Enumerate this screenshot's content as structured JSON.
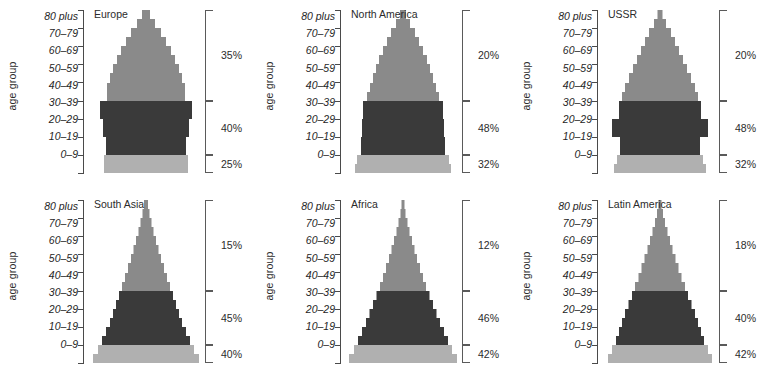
{
  "figure": {
    "type": "population-pyramid-grid",
    "rows": 2,
    "columns": 3,
    "background": "#ffffff"
  },
  "axis": {
    "title": "age group",
    "labels": [
      "80 plus",
      "70–79",
      "60–69",
      "50–59",
      "40–49",
      "30–39",
      "20–29",
      "10–19",
      "0–9"
    ]
  },
  "colors": {
    "band_old": "#8a8a8a",
    "band_middle": "#3a3a3a",
    "band_young": "#b0b0b0",
    "axis": "#4a4a4a",
    "text": "#2b2b2b"
  },
  "bands": [
    {
      "key": "old",
      "label": "40 plus",
      "color": "#8a8a8a"
    },
    {
      "key": "middle",
      "label": "10–39",
      "color": "#3a3a3a"
    },
    {
      "key": "young",
      "label": "0–9",
      "color": "#b0b0b0"
    }
  ],
  "chart_data": {
    "type": "bar",
    "title": "",
    "xlabel": "",
    "ylabel": "age group",
    "categories": [
      "0–4",
      "5–9",
      "10–14",
      "15–19",
      "20–24",
      "25–29",
      "30–34",
      "35–39",
      "40–44",
      "45–49",
      "50–54",
      "55–59",
      "60–64",
      "65–69",
      "70–74",
      "75–79",
      "80–84",
      "85 plus"
    ],
    "legend_position": "none",
    "grid": false,
    "panels": [
      {
        "name": "Europe",
        "position": {
          "row": 0,
          "col": 0
        },
        "percentages": [
          {
            "band": "old",
            "value": "35%"
          },
          {
            "band": "middle",
            "value": "40%"
          },
          {
            "band": "young",
            "value": "25%"
          }
        ],
        "widths": [
          84,
          84,
          80,
          80,
          86,
          86,
          92,
          92,
          78,
          78,
          72,
          66,
          58,
          50,
          40,
          30,
          18,
          8
        ]
      },
      {
        "name": "North America",
        "position": {
          "row": 0,
          "col": 1
        },
        "percentages": [
          {
            "band": "old",
            "value": "20%"
          },
          {
            "band": "middle",
            "value": "48%"
          },
          {
            "band": "young",
            "value": "32%"
          }
        ],
        "widths": [
          96,
          92,
          84,
          84,
          82,
          82,
          80,
          80,
          72,
          66,
          60,
          54,
          48,
          40,
          32,
          24,
          14,
          6
        ]
      },
      {
        "name": "USSR",
        "position": {
          "row": 0,
          "col": 2
        },
        "percentages": [
          {
            "band": "old",
            "value": "20%"
          },
          {
            "band": "middle",
            "value": "48%"
          },
          {
            "band": "young",
            "value": "32%"
          }
        ],
        "widths": [
          92,
          86,
          80,
          80,
          96,
          96,
          82,
          82,
          76,
          70,
          62,
          54,
          46,
          38,
          30,
          22,
          12,
          5
        ]
      },
      {
        "name": "South Asia",
        "position": {
          "row": 1,
          "col": 0
        },
        "percentages": [
          {
            "band": "old",
            "value": "15%"
          },
          {
            "band": "middle",
            "value": "45%"
          },
          {
            "band": "young",
            "value": "40%"
          }
        ],
        "widths": [
          106,
          96,
          88,
          80,
          72,
          66,
          60,
          54,
          48,
          42,
          36,
          30,
          25,
          20,
          15,
          11,
          7,
          4
        ]
      },
      {
        "name": "Africa",
        "position": {
          "row": 1,
          "col": 1
        },
        "percentages": [
          {
            "band": "old",
            "value": "12%"
          },
          {
            "band": "middle",
            "value": "46%"
          },
          {
            "band": "young",
            "value": "42%"
          }
        ],
        "widths": [
          108,
          98,
          90,
          82,
          74,
          67,
          60,
          53,
          46,
          40,
          34,
          28,
          23,
          18,
          13,
          9,
          5,
          3
        ]
      },
      {
        "name": "Latin America",
        "position": {
          "row": 1,
          "col": 2
        },
        "percentages": [
          {
            "band": "old",
            "value": "18%"
          },
          {
            "band": "middle",
            "value": "40%"
          },
          {
            "band": "young",
            "value": "42%"
          }
        ],
        "widths": [
          104,
          96,
          88,
          82,
          76,
          70,
          63,
          56,
          50,
          43,
          37,
          31,
          25,
          20,
          15,
          10,
          6,
          3
        ]
      }
    ]
  }
}
